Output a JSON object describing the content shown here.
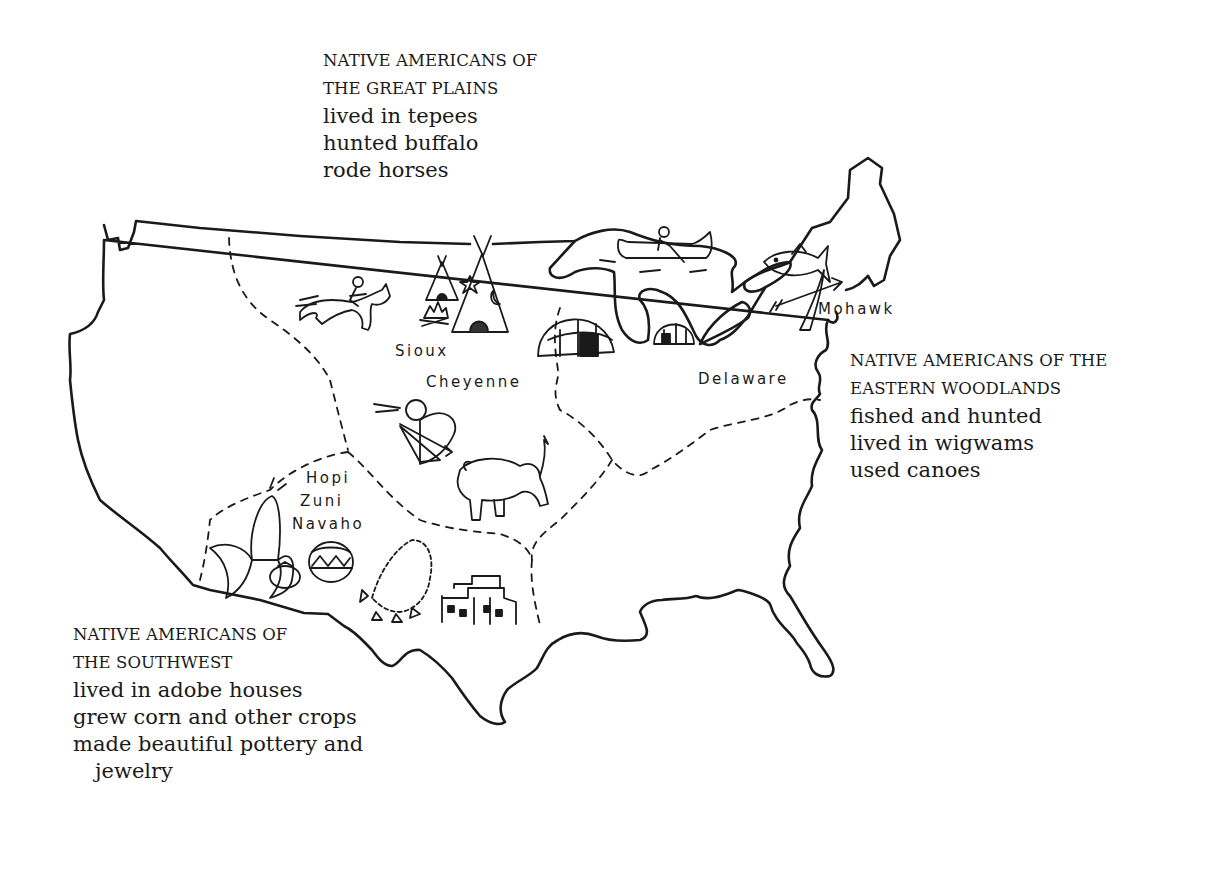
{
  "map": {
    "subject": "United States outline map of Native American cultural regions",
    "stroke_color": "#1a1a1a",
    "background": "#ffffff"
  },
  "regions": {
    "great_plains": {
      "heading_line1": "NATIVE AMERICANS OF",
      "heading_line2": "THE GREAT PLAINS",
      "traits": [
        "lived in tepees",
        "hunted buffalo",
        "rode horses"
      ]
    },
    "eastern_woodlands": {
      "heading_line1": "NATIVE AMERICANS OF THE",
      "heading_line2": "EASTERN WOODLANDS",
      "traits": [
        "fished and hunted",
        "lived in wigwams",
        "used canoes"
      ]
    },
    "southwest": {
      "heading_line1": "NATIVE AMERICANS OF",
      "heading_line2": "THE SOUTHWEST",
      "traits": [
        "lived in adobe houses",
        "grew corn and other crops",
        "made beautiful pottery and",
        "jewelry"
      ]
    }
  },
  "tribes": {
    "sioux": "Sioux",
    "cheyenne": "Cheyenne",
    "hopi": "Hopi",
    "zuni": "Zuni",
    "navaho": "Navaho",
    "mohawk": "Mohawk",
    "delaware": "Delaware"
  },
  "illustrations": [
    "horse-rider",
    "tepee-small",
    "tepee-large",
    "campfire",
    "archer",
    "buffalo",
    "wigwam-large",
    "wigwam-small",
    "canoe-paddler",
    "fish",
    "bow-arrow",
    "corn",
    "tomato",
    "pottery",
    "necklace",
    "adobe-pueblo"
  ]
}
